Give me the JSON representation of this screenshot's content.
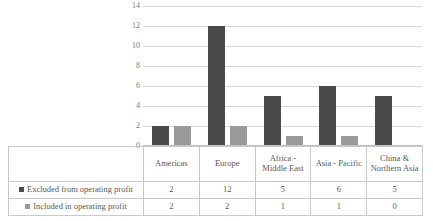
{
  "chart_data": {
    "type": "bar",
    "title": "",
    "xlabel": "",
    "ylabel": "",
    "ylim": [
      0,
      14
    ],
    "ytick_step": 2,
    "yticks": [
      14,
      12,
      10,
      8,
      6,
      4,
      2,
      0
    ],
    "grid": true,
    "legend_position": "data-table-left",
    "categories": [
      "Americas",
      "Europe",
      "Africa - Middle East",
      "Asia - Pacific",
      "China & Northern Asia"
    ],
    "series": [
      {
        "name": "Excluded from operating profit",
        "color": "#4a4a4a",
        "values": [
          2,
          12,
          5,
          6,
          5
        ]
      },
      {
        "name": "Included in operating profit",
        "color": "#9a9a9a",
        "values": [
          2,
          2,
          1,
          1,
          0
        ]
      }
    ]
  },
  "table": {
    "corner_label": "",
    "column_headers": [
      "Americas",
      "Europe",
      "Africa - Middle East",
      "Asia - Pacific",
      "China & Northern Asia"
    ],
    "rows": [
      {
        "label": "Excluded from operating profit",
        "cells": [
          "2",
          "12",
          "5",
          "6",
          "5"
        ]
      },
      {
        "label": "Included in operating profit",
        "cells": [
          "2",
          "2",
          "1",
          "1",
          "0"
        ]
      }
    ]
  },
  "colors": {
    "series_excluded": "#4a4a4a",
    "series_included": "#9a9a9a",
    "gridline": "#d9d9d9",
    "table_border": "#c9c9c9",
    "text": "#595959"
  }
}
